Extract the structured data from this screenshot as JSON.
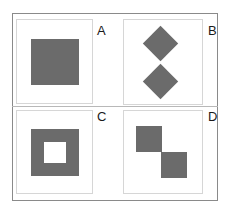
{
  "figure": {
    "panels": [
      {
        "id": "A",
        "label": "A",
        "shape": "solid-square"
      },
      {
        "id": "B",
        "label": "B",
        "shape": "two-stacked-diamonds"
      },
      {
        "id": "C",
        "label": "C",
        "shape": "hollow-square"
      },
      {
        "id": "D",
        "label": "D",
        "shape": "two-diagonal-squares"
      }
    ],
    "colors": {
      "fill": "#6b6b6b",
      "frame": "#8a8a8a",
      "panel_border": "#d6d6d6",
      "background": "#ffffff"
    }
  }
}
